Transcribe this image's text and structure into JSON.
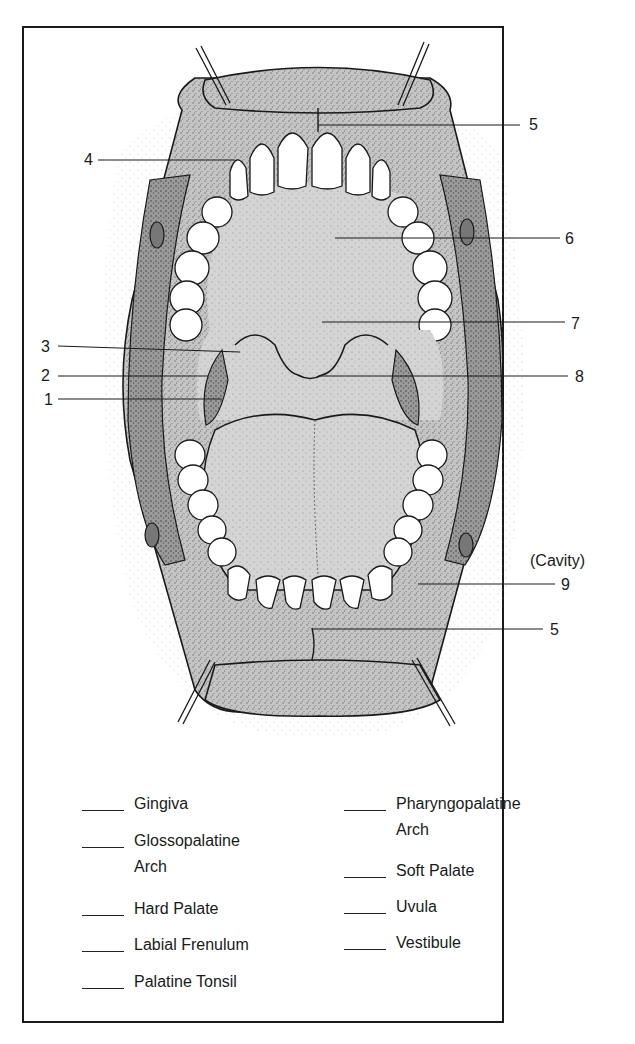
{
  "diagram": {
    "callouts": [
      {
        "number": "5",
        "side": "right",
        "target": "upper labial frenulum"
      },
      {
        "number": "4",
        "side": "left",
        "target": "upper gingiva"
      },
      {
        "number": "6",
        "side": "right",
        "target": "hard palate"
      },
      {
        "number": "7",
        "side": "right",
        "target": "soft palate"
      },
      {
        "number": "3",
        "side": "left",
        "target": "pharyngopalatine arch"
      },
      {
        "number": "2",
        "side": "left",
        "target": "glossopalatine arch"
      },
      {
        "number": "8",
        "side": "right",
        "target": "uvula"
      },
      {
        "number": "1",
        "side": "left",
        "target": "palatine tonsil"
      },
      {
        "number": "9",
        "side": "right",
        "target": "vestibule",
        "note": "(Cavity)"
      },
      {
        "number": "5",
        "side": "right",
        "target": "lower labial frenulum"
      }
    ],
    "cavity_note": "(Cavity)"
  },
  "legend": {
    "left_column": [
      {
        "line1": "Gingiva",
        "line2": ""
      },
      {
        "line1": "Glossopalatine",
        "line2": "Arch"
      },
      {
        "line1": "Hard Palate",
        "line2": ""
      },
      {
        "line1": "Labial Frenulum",
        "line2": ""
      },
      {
        "line1": "Palatine Tonsil",
        "line2": ""
      }
    ],
    "right_column": [
      {
        "line1": "Pharyngopalatine",
        "line2": "Arch"
      },
      {
        "line1": "Soft Palate",
        "line2": ""
      },
      {
        "line1": "Uvula",
        "line2": ""
      },
      {
        "line1": "Vestibule",
        "line2": ""
      }
    ]
  },
  "colors": {
    "ink": "#1a1a1a",
    "tissue": "#b9b9b9",
    "tissue_dark": "#8f8f8f",
    "tooth": "#ffffff",
    "paper": "#ffffff"
  }
}
